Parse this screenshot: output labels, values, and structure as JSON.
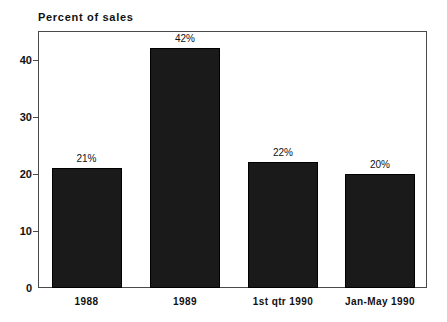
{
  "chart_data": {
    "type": "bar",
    "title": "Percent of sales",
    "xlabel": "",
    "ylabel": "Percent of sales",
    "categories": [
      "1988",
      "1989",
      "1st qtr 1990",
      "Jan-May 1990"
    ],
    "values": [
      21,
      42,
      22,
      20
    ],
    "value_labels": [
      "21%",
      "42%",
      "22%",
      "20%"
    ],
    "ylim": [
      0,
      45
    ],
    "yticks": [
      0,
      10,
      20,
      30,
      40
    ],
    "ytick_labels": [
      "0",
      "10",
      "20",
      "30",
      "40"
    ],
    "grid": false,
    "legend": "none",
    "bar_color": "#1a1a1a",
    "frame_color": "#4a4a4a",
    "background_color": "#ffffff"
  }
}
